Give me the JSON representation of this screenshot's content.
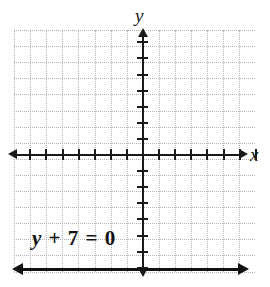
{
  "figure": {
    "title": "",
    "background_color": "#ffffff",
    "width": 270,
    "height": 287
  },
  "axes": {
    "x_label": "x",
    "y_label": "y",
    "axis_color": "#1a1a1a",
    "grid_color": "#b4b4b4",
    "grid_style": "dotted",
    "x_range": [
      -8,
      7
    ],
    "y_range": [
      -8,
      7
    ],
    "tick_step": 1,
    "x_tick_count_left": 7,
    "x_tick_count_right": 7,
    "y_tick_count_up": 7,
    "y_tick_count_down": 7,
    "arrowheads": "both-ends"
  },
  "annotation": {
    "equation_var": "y",
    "equation_rest": " + 7 = 0",
    "equation_full": "y + 7 = 0"
  },
  "chart_data": {
    "type": "line",
    "title": "",
    "xlabel": "x",
    "ylabel": "y",
    "xlim": [
      -8,
      7
    ],
    "ylim": [
      -8,
      7
    ],
    "grid": true,
    "legend": "none",
    "series": [
      {
        "name": "y + 7 = 0",
        "equation": "y = -7",
        "kind": "horizontal-line",
        "y_value": -7,
        "color": "#111111",
        "x": [
          -8,
          7
        ],
        "values": [
          -7,
          -7
        ],
        "extends_both_directions": true
      }
    ],
    "annotations": [
      {
        "text": "y + 7 = 0",
        "x": -6.5,
        "y": -5.2
      }
    ]
  }
}
